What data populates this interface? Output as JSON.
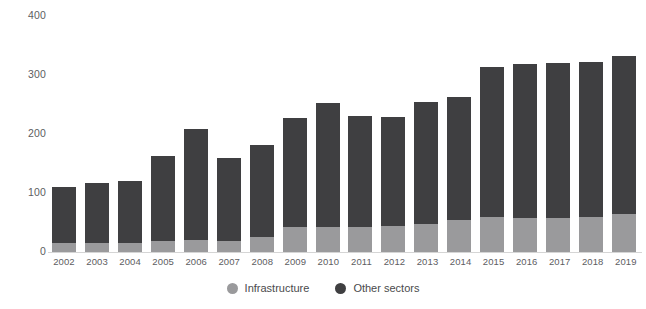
{
  "chart_data": {
    "type": "bar",
    "subtype": "stacked-bar",
    "title": "",
    "xlabel": "",
    "ylabel": "",
    "ylim": [
      0,
      400
    ],
    "yticks": [
      0,
      100,
      200,
      300,
      400
    ],
    "grid": false,
    "legend_position": "bottom-center",
    "categories": [
      "2002",
      "2003",
      "2004",
      "2005",
      "2006",
      "2007",
      "2008",
      "2009",
      "2010",
      "2011",
      "2012",
      "2013",
      "2014",
      "2015",
      "2016",
      "2017",
      "2018",
      "2019"
    ],
    "series": [
      {
        "name": "Infrastructure",
        "color": "#9a9a9c",
        "values": [
          16,
          15,
          16,
          19,
          21,
          19,
          26,
          42,
          42,
          42,
          44,
          48,
          54,
          59,
          57,
          58,
          60,
          64
        ]
      },
      {
        "name": "Other sectors",
        "color": "#3f3f41",
        "values": [
          94,
          102,
          104,
          143,
          187,
          141,
          156,
          185,
          210,
          189,
          185,
          207,
          208,
          254,
          261,
          262,
          262,
          268
        ]
      }
    ],
    "totals": [
      110,
      117,
      120,
      162,
      208,
      160,
      182,
      227,
      252,
      231,
      229,
      255,
      262,
      313,
      318,
      320,
      322,
      332
    ]
  },
  "axis": {
    "y_tick_labels": [
      "400",
      "300",
      "200",
      "100",
      "0"
    ],
    "y_tick_values": [
      400,
      300,
      200,
      100,
      0
    ]
  },
  "legend": {
    "items": [
      {
        "label": "Infrastructure",
        "color": "#9a9a9c",
        "marker": "circle-marker"
      },
      {
        "label": "Other sectors",
        "color": "#3f3f41",
        "marker": "circle-marker"
      }
    ]
  },
  "colors": {
    "infrastructure": "#9a9a9c",
    "other_sectors": "#3f3f41",
    "axis_text": "#5d5d5f",
    "baseline": "#d5d5d5",
    "background": "#ffffff"
  }
}
